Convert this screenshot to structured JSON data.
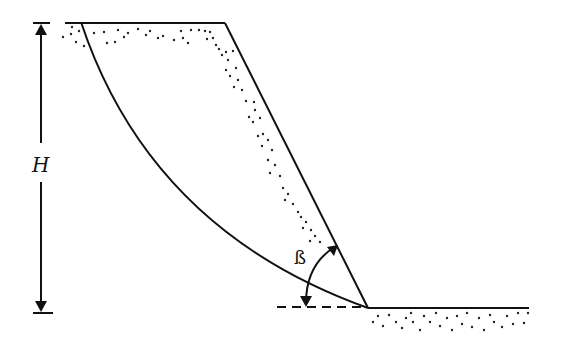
{
  "diagram": {
    "type": "slope-failure-diagram",
    "labels": {
      "height": "H",
      "angle": "ß"
    },
    "elements": [
      "top-ground-surface",
      "slope-face",
      "toe-ground-surface",
      "circular-failure-surface",
      "height-dimension-arrow",
      "slope-angle-arc",
      "horizontal-dashed-reference",
      "soil-stipple"
    ],
    "colors": {
      "line": "#111111",
      "background": "#ffffff"
    }
  }
}
